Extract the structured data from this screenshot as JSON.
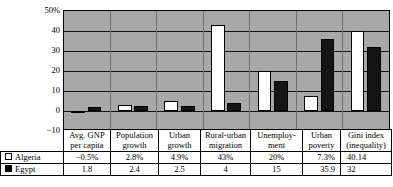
{
  "chart_data": {
    "type": "bar",
    "title": "",
    "xlabel": "",
    "ylabel": "",
    "ylim": [
      -10,
      50
    ],
    "yticks": [
      "50%",
      "40",
      "30",
      "20",
      "10",
      "0",
      "-10"
    ],
    "grid": true,
    "legend_position": "table-left",
    "categories": [
      "Avg. GNP per capita",
      "Population growth",
      "Urban growth",
      "Rural-urban migration",
      "Unemployment",
      "Urban poverty",
      "Gini index (inequality)"
    ],
    "series": [
      {
        "name": "Algeria",
        "swatch": "open-square",
        "values": [
          -0.5,
          2.8,
          4.9,
          43,
          20,
          7.3,
          40.14
        ],
        "labels": [
          "-0.5%",
          "2.8%",
          "4.9%",
          "43%",
          "20%",
          "7.3%",
          "40.14"
        ]
      },
      {
        "name": "Egypt",
        "swatch": "filled-square",
        "values": [
          1.8,
          2.4,
          2.5,
          4,
          15,
          35.9,
          32
        ],
        "labels": [
          "1.8",
          "2.4",
          "2.5",
          "4",
          "15",
          "35.9",
          "32"
        ]
      }
    ]
  },
  "axis": {
    "ticks": [
      {
        "label": "50%",
        "value": 50
      },
      {
        "label": "40",
        "value": 40
      },
      {
        "label": "30",
        "value": 30
      },
      {
        "label": "20",
        "value": 20
      },
      {
        "label": "10",
        "value": 10
      },
      {
        "label": "0",
        "value": 0
      },
      {
        "label": "-10",
        "value": -10
      }
    ]
  },
  "table": {
    "headers": [
      {
        "line1": "Avg. GNP",
        "line2": "per capita"
      },
      {
        "line1": "Population",
        "line2": "growth"
      },
      {
        "line1": "Urban",
        "line2": "growth"
      },
      {
        "line1": "Rural-urban",
        "line2": "migration"
      },
      {
        "line1": "Unemploy-",
        "line2": "ment"
      },
      {
        "line1": "Urban",
        "line2": "poverty"
      },
      {
        "line1": "Gini index",
        "line2": "(inequality)"
      }
    ],
    "rows": [
      {
        "name": "Algeria",
        "swatch": "open-square",
        "cells": [
          "-0.5%",
          "2.8%",
          "4.9%",
          "43%",
          "20%",
          "7.3%",
          "40.14"
        ]
      },
      {
        "name": "Egypt",
        "swatch": "filled-square",
        "cells": [
          "1.8",
          "2.4",
          "2.5",
          "4",
          "15",
          "35.9",
          "32"
        ]
      }
    ]
  },
  "colors": {
    "plot_background": "#a8a8a8",
    "series_algeria": "#ffffff",
    "series_egypt": "#151515",
    "axis": "#000000"
  }
}
